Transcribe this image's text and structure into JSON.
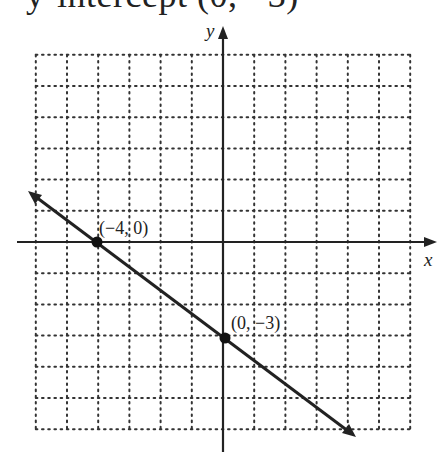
{
  "header": {
    "cut_text": "y-intercept (0, −3)"
  },
  "chart_data": {
    "type": "line",
    "title": "",
    "xlabel": "x",
    "ylabel": "y",
    "xlim": [
      -6,
      6
    ],
    "ylim": [
      -6,
      6
    ],
    "grid": true,
    "grid_style": "dotted",
    "series": [
      {
        "name": "line",
        "equation": "y = -3/4 x - 3",
        "slope": -0.75,
        "intercept": -3,
        "x": [
          -6,
          4
        ],
        "y": [
          -1.5,
          -6
        ],
        "arrows": "both"
      }
    ],
    "points": [
      {
        "x": -4,
        "y": 0,
        "label": "(−4, 0)"
      },
      {
        "x": 0,
        "y": -3,
        "label": "(0, −3)"
      }
    ]
  },
  "labels": {
    "x_axis": "x",
    "y_axis": "y",
    "point1": "(−4, 0)",
    "point2": "(0, −3)"
  },
  "colors": {
    "ink": "#222222",
    "grid": "#333333",
    "background": "#ffffff"
  }
}
